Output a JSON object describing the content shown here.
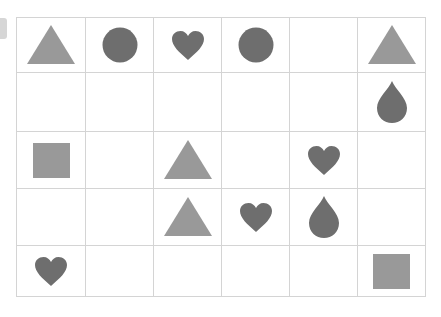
{
  "colors": {
    "light": "#999999",
    "dark": "#6e6e6e",
    "grid_line": "#d4d4d4"
  },
  "grid": {
    "rows": 5,
    "cols": 6,
    "cells": [
      [
        "triangle",
        "circle",
        "heart",
        "circle",
        "",
        "triangle"
      ],
      [
        "",
        "",
        "",
        "",
        "",
        "drop"
      ],
      [
        "square",
        "",
        "triangle",
        "",
        "heart",
        ""
      ],
      [
        "",
        "",
        "triangle",
        "heart",
        "drop",
        ""
      ],
      [
        "heart",
        "",
        "",
        "",
        "",
        "square"
      ]
    ]
  }
}
